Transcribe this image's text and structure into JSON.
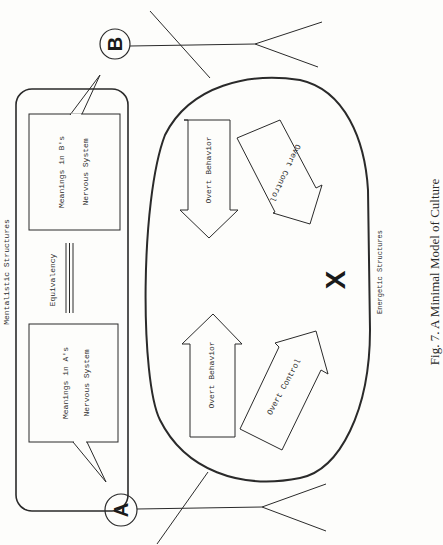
{
  "figure": {
    "caption": "Fig. 7. A Minimal Model of Culture",
    "orientation": "rotated-90-ccw"
  },
  "mentalistic": {
    "label": "Mentalistic   Structures",
    "box_a": {
      "line1": "Meanings  in  A's",
      "line2": "Nervous  System"
    },
    "box_b": {
      "line1": "Meanings  in  B's",
      "line2": "Nervous  System"
    },
    "equivalency": "Equivalency"
  },
  "energetic": {
    "label": "Energetic   Structures",
    "center_mark": "X",
    "arrows": {
      "a_behavior": "Overt  Behavior",
      "a_control": "Overt  Control",
      "b_behavior": "Overt  Behavior",
      "b_control": "Overt  Control"
    }
  },
  "persons": {
    "a": {
      "label": "A"
    },
    "b": {
      "label": "B"
    }
  },
  "colors": {
    "ink": "#2a2a2a",
    "paper": "#fdfdfb"
  }
}
